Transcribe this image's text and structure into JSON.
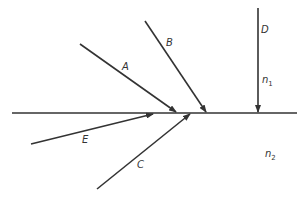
{
  "diagram": {
    "title": "",
    "interface": {
      "x1": 12,
      "y1": 113,
      "x2": 297,
      "y2": 113
    },
    "media": [
      {
        "label": "n",
        "subscript": "1",
        "x": 262,
        "y": 83
      },
      {
        "label": "n",
        "subscript": "2",
        "x": 265,
        "y": 157
      }
    ],
    "rays": [
      {
        "label": "A",
        "x1": 80,
        "y1": 44,
        "x2": 176,
        "y2": 112,
        "lx": 122,
        "ly": 70
      },
      {
        "label": "B",
        "x1": 145,
        "y1": 21,
        "x2": 206,
        "y2": 112,
        "lx": 166,
        "ly": 46
      },
      {
        "label": "D",
        "x1": 258,
        "y1": 8,
        "x2": 258,
        "y2": 112,
        "lx": 261,
        "ly": 33
      },
      {
        "label": "E",
        "x1": 31,
        "y1": 144,
        "x2": 153,
        "y2": 114,
        "lx": 82,
        "ly": 143
      },
      {
        "label": "C",
        "x1": 97,
        "y1": 189,
        "x2": 190,
        "y2": 114,
        "lx": 137,
        "ly": 168
      }
    ],
    "colors": {
      "line": "#333333",
      "background": "#ffffff"
    }
  }
}
